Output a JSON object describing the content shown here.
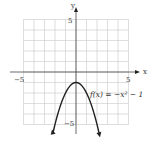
{
  "chart_data": {
    "type": "line",
    "title": "",
    "function_label": "f(x) = −x² − 1",
    "xlabel": "x",
    "ylabel": "y",
    "xlim": [
      -5,
      5
    ],
    "ylim": [
      -5,
      5
    ],
    "grid": true,
    "tick_labels": {
      "x_neg": "−5",
      "x_pos": "5",
      "y_pos": "5",
      "y_neg": "−5"
    },
    "series": [
      {
        "name": "f(x) = -x^2 - 1",
        "x": [
          -2.3,
          -2,
          -1.5,
          -1,
          -0.5,
          0,
          0.5,
          1,
          1.5,
          2,
          2.3
        ],
        "y": [
          -6.29,
          -5,
          -3.25,
          -2,
          -1.25,
          -1,
          -1.25,
          -2,
          -3.25,
          -5,
          -6.29
        ]
      }
    ],
    "vertex": [
      0,
      -1
    ],
    "arrows_on_ends": true
  },
  "colors": {
    "grid": "#c8c8c8",
    "axis": "#444444",
    "curve": "#222222"
  }
}
